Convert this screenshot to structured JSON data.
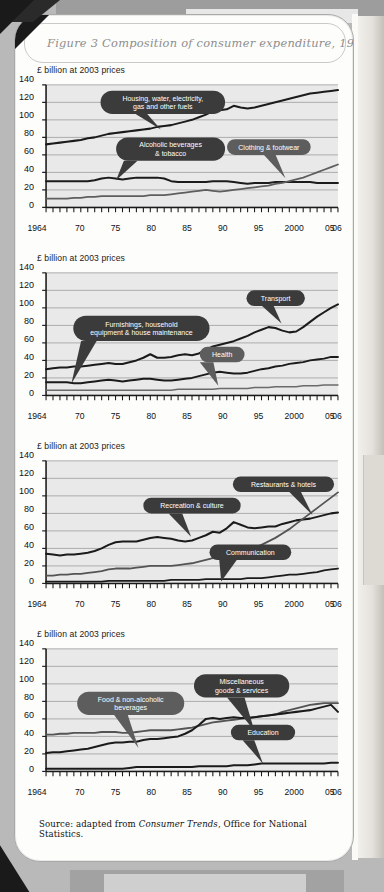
{
  "figure": {
    "title": "Figure 3   Composition of consumer expenditure, 1964-2006",
    "source_prefix": "Source: adapted from ",
    "source_italic": "Consumer Trends",
    "source_suffix": ", Office for National Statistics.",
    "axis_caption": "£ billion at 2003 prices",
    "accent_callout": "#3b3b3b",
    "accent_callout_light": "#6f6f6f",
    "plot_background": "#e9e9e9",
    "line_color_dark": "#1d1d1d",
    "line_color_mid": "#555555",
    "gridline_color": "#9a9a9a"
  },
  "axes": {
    "y_ticks": [
      0,
      20,
      40,
      60,
      80,
      100,
      120,
      140
    ],
    "ylim": [
      0,
      140
    ],
    "x_ticks": [
      {
        "year": 1964,
        "label": "1964"
      },
      {
        "year": 1970,
        "label": "70"
      },
      {
        "year": 1975,
        "label": "75"
      },
      {
        "year": 1980,
        "label": "80"
      },
      {
        "year": 1985,
        "label": "85"
      },
      {
        "year": 1990,
        "label": "90"
      },
      {
        "year": 1995,
        "label": "95"
      },
      {
        "year": 2000,
        "label": "2000"
      },
      {
        "year": 2005,
        "label": "05"
      },
      {
        "year": 2006,
        "label": "06"
      }
    ],
    "xlim": [
      1964,
      2006
    ]
  },
  "chart_data": [
    {
      "type": "line",
      "title": "Composition of consumer expenditure, 1964-2006 (panel 1)",
      "xlabel": "",
      "ylabel": "£ billion at 2003 prices",
      "ylim": [
        0,
        140
      ],
      "grid": true,
      "legend": "callouts",
      "x": [
        1964,
        1965,
        1966,
        1967,
        1968,
        1969,
        1970,
        1971,
        1972,
        1973,
        1974,
        1975,
        1976,
        1977,
        1978,
        1979,
        1980,
        1981,
        1982,
        1983,
        1984,
        1985,
        1986,
        1987,
        1988,
        1989,
        1990,
        1991,
        1992,
        1993,
        1994,
        1995,
        1996,
        1997,
        1998,
        1999,
        2000,
        2001,
        2002,
        2003,
        2004,
        2005,
        2006
      ],
      "series": [
        {
          "name": "Housing, water, electricity, gas and other fuels",
          "callout": "Housing, water, electricity,\ngas and other fuels",
          "values": [
            72,
            73,
            74,
            75,
            76,
            77,
            79,
            80,
            82,
            84,
            85,
            86,
            87,
            88,
            89,
            90,
            92,
            93,
            94,
            96,
            98,
            100,
            103,
            106,
            110,
            111,
            112,
            116,
            114,
            113,
            114,
            116,
            118,
            120,
            122,
            124,
            126,
            128,
            130,
            131,
            132,
            133,
            134
          ]
        },
        {
          "name": "Alcoholic beverages & tobacco",
          "callout": "Alcoholic beverages\n& tobacco",
          "values": [
            30,
            30,
            30,
            30,
            30,
            30,
            30,
            31,
            33,
            34,
            33,
            32,
            33,
            34,
            34,
            34,
            34,
            33,
            30,
            29,
            29,
            29,
            29,
            29,
            30,
            30,
            30,
            29,
            28,
            27,
            28,
            28,
            28,
            29,
            29,
            29,
            29,
            29,
            29,
            28,
            28,
            28,
            28
          ]
        },
        {
          "name": "Clothing & footwear",
          "callout": "Clothing & footwear",
          "values": [
            10,
            10,
            10,
            10,
            11,
            11,
            12,
            12,
            13,
            13,
            13,
            13,
            13,
            13,
            13,
            14,
            14,
            14,
            15,
            16,
            17,
            18,
            19,
            20,
            19,
            18,
            19,
            20,
            21,
            22,
            23,
            24,
            25,
            27,
            28,
            30,
            32,
            34,
            37,
            40,
            43,
            46,
            49
          ]
        }
      ]
    },
    {
      "type": "line",
      "title": "Composition of consumer expenditure, 1964-2006 (panel 2)",
      "xlabel": "",
      "ylabel": "£ billion at 2003 prices",
      "ylim": [
        0,
        140
      ],
      "grid": true,
      "legend": "callouts",
      "x": [
        1964,
        1965,
        1966,
        1967,
        1968,
        1969,
        1970,
        1971,
        1972,
        1973,
        1974,
        1975,
        1976,
        1977,
        1978,
        1979,
        1980,
        1981,
        1982,
        1983,
        1984,
        1985,
        1986,
        1987,
        1988,
        1989,
        1990,
        1991,
        1992,
        1993,
        1994,
        1995,
        1996,
        1997,
        1998,
        1999,
        2000,
        2001,
        2002,
        2003,
        2004,
        2005,
        2006
      ],
      "series": [
        {
          "name": "Transport",
          "callout": "Transport",
          "values": [
            30,
            31,
            32,
            32,
            33,
            33,
            34,
            35,
            36,
            37,
            36,
            36,
            38,
            40,
            43,
            47,
            43,
            43,
            44,
            46,
            47,
            46,
            48,
            52,
            56,
            58,
            60,
            62,
            65,
            68,
            72,
            75,
            78,
            77,
            74,
            72,
            73,
            78,
            84,
            90,
            95,
            100,
            104,
            108
          ]
        },
        {
          "name": "Furnishings, household equipment & house maintenance",
          "callout": "Furnishings, household\nequipment & house maintenance",
          "values": [
            15,
            15,
            15,
            15,
            14,
            14,
            15,
            16,
            17,
            18,
            17,
            16,
            17,
            18,
            19,
            19,
            18,
            17,
            17,
            18,
            19,
            20,
            22,
            24,
            26,
            27,
            26,
            25,
            25,
            26,
            28,
            30,
            31,
            33,
            34,
            36,
            37,
            38,
            40,
            41,
            42,
            44,
            44
          ]
        },
        {
          "name": "Health",
          "callout": "Health",
          "values": [
            6,
            6,
            6,
            6,
            6,
            6,
            6,
            6,
            6,
            6,
            6,
            6,
            6,
            6,
            6,
            6,
            6,
            6,
            6,
            7,
            7,
            7,
            7,
            7,
            7,
            8,
            8,
            8,
            8,
            8,
            9,
            9,
            9,
            10,
            10,
            10,
            10,
            11,
            11,
            11,
            12,
            12,
            12
          ]
        }
      ]
    },
    {
      "type": "line",
      "title": "Composition of consumer expenditure, 1964-2006 (panel 3)",
      "xlabel": "",
      "ylabel": "£ billion at 2003 prices",
      "ylim": [
        0,
        140
      ],
      "grid": true,
      "legend": "callouts",
      "x": [
        1964,
        1965,
        1966,
        1967,
        1968,
        1969,
        1970,
        1971,
        1972,
        1973,
        1974,
        1975,
        1976,
        1977,
        1978,
        1979,
        1980,
        1981,
        1982,
        1983,
        1984,
        1985,
        1986,
        1987,
        1988,
        1989,
        1990,
        1991,
        1992,
        1993,
        1994,
        1995,
        1996,
        1997,
        1998,
        1999,
        2000,
        2001,
        2002,
        2003,
        2004,
        2005,
        2006
      ],
      "series": [
        {
          "name": "Restaurants & hotels",
          "callout": "Restaurants & hotels",
          "values": [
            34,
            33,
            32,
            33,
            33,
            34,
            35,
            37,
            40,
            44,
            47,
            48,
            48,
            48,
            50,
            52,
            53,
            52,
            51,
            49,
            48,
            49,
            52,
            55,
            59,
            58,
            63,
            70,
            67,
            64,
            63,
            64,
            65,
            65,
            68,
            70,
            72,
            73,
            74,
            76,
            78,
            80,
            81
          ]
        },
        {
          "name": "Recreation & culture",
          "callout": "Recreation & culture",
          "values": [
            9,
            9,
            10,
            10,
            11,
            11,
            12,
            13,
            14,
            16,
            17,
            17,
            17,
            18,
            19,
            20,
            20,
            20,
            20,
            21,
            22,
            23,
            25,
            27,
            29,
            31,
            34,
            35,
            36,
            38,
            41,
            44,
            48,
            52,
            57,
            62,
            68,
            74,
            80,
            86,
            92,
            98,
            104
          ]
        },
        {
          "name": "Communication",
          "callout": "Communication",
          "values": [
            2,
            2,
            2,
            2,
            2,
            2,
            2,
            2,
            2,
            3,
            3,
            3,
            3,
            3,
            3,
            3,
            3,
            3,
            4,
            4,
            4,
            4,
            4,
            5,
            5,
            5,
            5,
            5,
            5,
            6,
            6,
            6,
            7,
            8,
            9,
            10,
            10,
            11,
            12,
            13,
            15,
            16,
            17
          ]
        }
      ]
    },
    {
      "type": "line",
      "title": "Composition of consumer expenditure, 1964-2006 (panel 4)",
      "xlabel": "",
      "ylabel": "£ billion at 2003 prices",
      "ylim": [
        0,
        140
      ],
      "grid": true,
      "legend": "callouts",
      "x": [
        1964,
        1965,
        1966,
        1967,
        1968,
        1969,
        1970,
        1971,
        1972,
        1973,
        1974,
        1975,
        1976,
        1977,
        1978,
        1979,
        1980,
        1981,
        1982,
        1983,
        1984,
        1985,
        1986,
        1987,
        1988,
        1989,
        1990,
        1991,
        1992,
        1993,
        1994,
        1995,
        1996,
        1997,
        1998,
        1999,
        2000,
        2001,
        2002,
        2003,
        2004,
        2005,
        2006
      ],
      "series": [
        {
          "name": "Food & non-alcoholic beverages",
          "callout": "Food & non-alcoholic\nbeverages",
          "values": [
            42,
            42,
            43,
            43,
            44,
            44,
            44,
            44,
            45,
            45,
            45,
            44,
            44,
            45,
            46,
            47,
            47,
            47,
            47,
            48,
            49,
            50,
            52,
            54,
            56,
            57,
            58,
            59,
            60,
            61,
            62,
            63,
            64,
            65,
            68,
            70,
            72,
            74,
            76,
            77,
            78,
            78,
            78
          ]
        },
        {
          "name": "Miscellaneous goods & services",
          "callout": "Miscellaneous\ngoods & services",
          "values": [
            21,
            22,
            22,
            23,
            24,
            25,
            26,
            28,
            30,
            32,
            33,
            33,
            34,
            34,
            36,
            37,
            37,
            38,
            39,
            40,
            43,
            47,
            53,
            60,
            61,
            60,
            61,
            62,
            61,
            61,
            62,
            63,
            64,
            65,
            66,
            67,
            68,
            69,
            70,
            72,
            74,
            76,
            68
          ]
        },
        {
          "name": "Education",
          "callout": "Education",
          "values": [
            3,
            3,
            3,
            3,
            3,
            3,
            3,
            3,
            3,
            3,
            3,
            3,
            4,
            5,
            5,
            5,
            5,
            5,
            5,
            5,
            5,
            5,
            6,
            6,
            6,
            6,
            6,
            7,
            7,
            7,
            8,
            9,
            9,
            9,
            9,
            9,
            9,
            9,
            9,
            9,
            9,
            10,
            10
          ]
        }
      ]
    }
  ]
}
